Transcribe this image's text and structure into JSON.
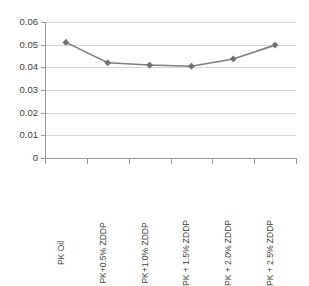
{
  "chart_data": {
    "type": "line",
    "title": "",
    "xlabel": "",
    "ylabel": "",
    "categories": [
      "PK Oil",
      "PK+0.5% ZDDP",
      "PK+1.0% ZDDP",
      "PK + 1.5% ZDDP",
      "PK + 2.0% ZDDP",
      "PK + 2.5% ZDDP"
    ],
    "values": [
      0.051,
      0.042,
      0.041,
      0.0405,
      0.0437,
      0.0498
    ],
    "ylim": [
      0,
      0.06
    ],
    "ytick_labels": [
      "0.06",
      "0.05",
      "0.04",
      "0.03",
      "0.02",
      "0.01",
      "0"
    ],
    "ytick_values": [
      0.06,
      0.05,
      0.04,
      0.03,
      0.02,
      0.01,
      0
    ],
    "grid": true,
    "legend": false,
    "legend_position": "none",
    "series_color": "#808080",
    "marker": "diamond",
    "marker_color": "#707070",
    "gridline_color": "#d6d6d6",
    "axis_color": "#9a9a9a"
  }
}
